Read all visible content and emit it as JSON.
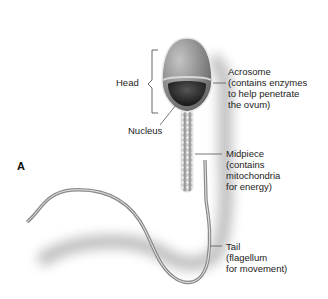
{
  "figure": {
    "panel_letter": "A",
    "labels": {
      "head": "Head",
      "nucleus": "Nucleus",
      "acrosome": {
        "line1": "Acrosome",
        "line2": "(contains enzymes",
        "line3": "to help penetrate",
        "line4": "the ovum)"
      },
      "midpiece": {
        "line1": "Midpiece",
        "line2": "(contains",
        "line3": "mitochondria",
        "line4": "for energy)"
      },
      "tail": {
        "line1": "Tail",
        "line2": "(flagellum",
        "line3": "for movement)"
      }
    },
    "colors": {
      "head_fill": "#8f8f8f",
      "nucleus_fill": "#2a2a2a",
      "outline": "#e8e8e8",
      "shadow": "#9a9a9a",
      "leader_line": "#555555"
    }
  }
}
